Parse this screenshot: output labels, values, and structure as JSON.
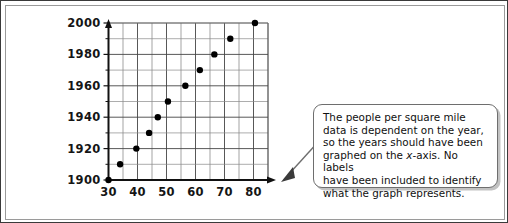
{
  "chart_data": {
    "type": "scatter",
    "title": "",
    "subtitle": "",
    "xlabel": "",
    "ylabel": "",
    "xlim": [
      30,
      85
    ],
    "ylim": [
      1900,
      2000
    ],
    "xticks": [
      30,
      40,
      50,
      60,
      70,
      80
    ],
    "yticks": [
      1900,
      1920,
      1940,
      1960,
      1980,
      2000
    ],
    "xtick_labels": [
      "30",
      "40",
      "50",
      "60",
      "70",
      "80"
    ],
    "ytick_labels": [
      "1900",
      "1920",
      "1940",
      "1960",
      "1980",
      "2000"
    ],
    "x_minor_step": 5,
    "y_minor_step": 10,
    "grid": true,
    "legend": "none",
    "series": [
      {
        "name": "people per square mile vs year",
        "marker": "filled-circle",
        "marker_color": "#000000",
        "points": [
          {
            "x": 30.0,
            "y": 1900
          },
          {
            "x": 34.0,
            "y": 1910
          },
          {
            "x": 39.6,
            "y": 1920
          },
          {
            "x": 44.0,
            "y": 1930
          },
          {
            "x": 47.0,
            "y": 1940
          },
          {
            "x": 50.5,
            "y": 1950
          },
          {
            "x": 56.5,
            "y": 1960
          },
          {
            "x": 61.5,
            "y": 1970
          },
          {
            "x": 66.5,
            "y": 1980
          },
          {
            "x": 72.0,
            "y": 1990
          },
          {
            "x": 80.5,
            "y": 2000
          }
        ]
      }
    ]
  },
  "annotation": {
    "callout_text": "The people per square mile data is dependent on the year, so the years should have been graphed on the x-axis. No labels have been included to identify what the graph represents.",
    "callout_lines": [
      "The people per square mile",
      "data is dependent on the year,",
      "so the years should have been",
      "graphed on the x-axis. No labels",
      "have been included to identify",
      "what the graph represents."
    ],
    "pointer_direction": "down-left"
  },
  "colors": {
    "frame_border": "#3a3a3a",
    "inner_border": "#9a9a9a",
    "axis": "#111111",
    "grid": "#4a4a4a",
    "marker": "#000000",
    "callout_border": "#6e6e6e",
    "text": "#101010"
  }
}
